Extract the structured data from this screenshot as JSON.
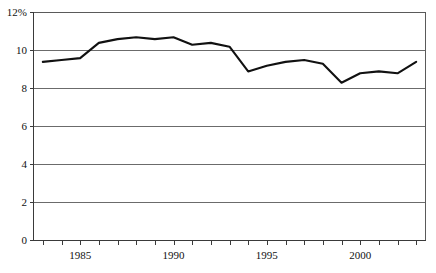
{
  "chart_data": {
    "type": "line",
    "title": "",
    "subtitle": "",
    "xlabel": "",
    "ylabel": "",
    "xlim": [
      1982.5,
      2003.5
    ],
    "ylim": [
      0,
      12
    ],
    "grid": true,
    "legend": null,
    "legend_position": "none",
    "y_axis": {
      "ticks": [
        0,
        2,
        4,
        6,
        8,
        10,
        12
      ],
      "tick_labels": [
        "0",
        "2",
        "4",
        "6",
        "8",
        "10",
        "12%"
      ],
      "top_label": "12%",
      "unit": "%"
    },
    "x_axis": {
      "major_ticks": [
        1985,
        1990,
        1995,
        2000
      ],
      "major_tick_labels": [
        "1985",
        "1990",
        "1995",
        "2000"
      ],
      "minor_tick_interval": 1,
      "first_tick": 1983,
      "last_tick": 2003
    },
    "series": [
      {
        "name": "series-1",
        "color": "#111111",
        "x": [
          1983,
          1984,
          1985,
          1986,
          1987,
          1988,
          1989,
          1990,
          1991,
          1992,
          1993,
          1994,
          1995,
          1996,
          1997,
          1998,
          1999,
          2000,
          2001,
          2002,
          2003
        ],
        "values": [
          9.4,
          9.5,
          9.6,
          10.4,
          10.6,
          10.7,
          10.6,
          10.7,
          10.3,
          10.4,
          10.2,
          8.9,
          9.2,
          9.4,
          9.5,
          9.3,
          8.3,
          8.8,
          8.9,
          8.8,
          9.4
        ]
      }
    ]
  },
  "axis_labels": {
    "y": [
      "12%",
      "10",
      "8",
      "6",
      "4",
      "2",
      "0"
    ],
    "x": [
      "1985",
      "1990",
      "1995",
      "2000"
    ]
  }
}
